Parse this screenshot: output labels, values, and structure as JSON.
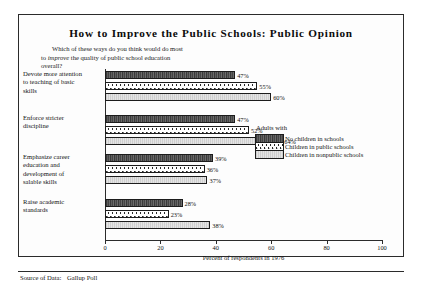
{
  "chart_data": {
    "type": "bar",
    "orientation": "horizontal",
    "title": "How to Improve the Public Schools: Public Opinion",
    "subtitle_line1": "Which of these ways do you think would do most",
    "subtitle_line2_pre": "to ",
    "subtitle_line2_em": "improve",
    "subtitle_line2_post": " the quality of public school education",
    "subtitle_line3": "overall?",
    "xlabel": "Percent of respondents in 1976",
    "ylabel": "",
    "xlim": [
      0,
      100
    ],
    "xticks": [
      0,
      20,
      40,
      60,
      80,
      100
    ],
    "xticklabels": [
      "0",
      "20",
      "40",
      "60",
      "80",
      "100"
    ],
    "grid": false,
    "legend_position": "center-right",
    "legend_title": "Adults with",
    "categories": [
      "Devote more attention to teaching of basic skills",
      "Enforce stricter discipline",
      "Emphasize career education and development of salable skills",
      "Raise academic standards"
    ],
    "category_labels": [
      [
        "Devote more attention",
        "to teaching of basic",
        "skills"
      ],
      [
        "Enforce stricter",
        "discipline"
      ],
      [
        "Emphasize career",
        "education and",
        "development of",
        "salable skills"
      ],
      [
        "Raise academic",
        "standards"
      ]
    ],
    "series": [
      {
        "name": "No children in schools",
        "values": [
          47,
          47,
          39,
          28
        ],
        "value_labels": [
          "47%",
          "47%",
          "39%",
          "28%"
        ],
        "pattern": "dark-hatch"
      },
      {
        "name": "Children in public schools",
        "values": [
          55,
          52,
          36,
          23
        ],
        "value_labels": [
          "55%",
          "52%",
          "36%",
          "23%"
        ],
        "pattern": "white-dots"
      },
      {
        "name": "Children in nonpublic schools",
        "values": [
          60,
          64,
          37,
          38
        ],
        "value_labels": [
          "60%",
          "64%",
          "37%",
          "38%"
        ],
        "pattern": "light-grey"
      }
    ],
    "source_label": "Source of Data:",
    "source_value": "Gallup Poll"
  }
}
